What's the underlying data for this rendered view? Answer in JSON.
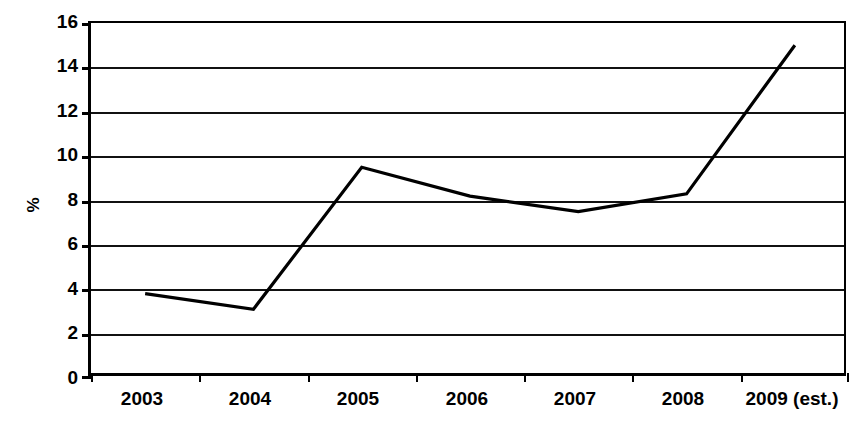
{
  "chart_data": {
    "type": "line",
    "title": "",
    "subtitle": "",
    "xlabel": "",
    "ylabel": "%",
    "categories": [
      "2003",
      "2004",
      "2005",
      "2006",
      "2007",
      "2008",
      "2009 (est.)"
    ],
    "values": [
      3.8,
      3.1,
      9.5,
      8.2,
      7.5,
      8.3,
      15.0
    ],
    "series": [
      {
        "name": "",
        "values": [
          3.8,
          3.1,
          9.5,
          8.2,
          7.5,
          8.3,
          15.0
        ]
      }
    ],
    "ylim": [
      0,
      16
    ],
    "ytick_labels": [
      "16",
      "14",
      "12",
      "10",
      "8",
      "6",
      "4",
      "2",
      "0"
    ],
    "ytick_values": [
      16,
      14,
      12,
      10,
      8,
      6,
      4,
      2,
      0
    ],
    "ytick_step": 2,
    "grid": "horizontal",
    "legend": "none",
    "annotations": [],
    "line_color": "#000000",
    "background_color": "#ffffff",
    "axis_color": "#000000"
  }
}
